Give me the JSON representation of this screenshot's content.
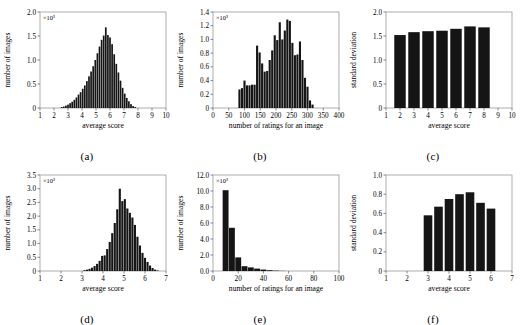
{
  "figure": {
    "panels": [
      {
        "id": "a",
        "caption": "(a)",
        "xlabel": "average score",
        "ylabel": "number of images",
        "exponent": "×10³",
        "xticks": [
          "1",
          "2",
          "3",
          "4",
          "5",
          "6",
          "7",
          "8",
          "9",
          "10"
        ],
        "yticks": [
          "0",
          "0.5",
          "1.0",
          "1.5",
          "2.0"
        ]
      },
      {
        "id": "b",
        "caption": "(b)",
        "xlabel": "number of ratings for an image",
        "ylabel": "number of images",
        "exponent": "×10³",
        "xticks": [
          "0",
          "50",
          "100",
          "150",
          "200",
          "250",
          "300",
          "350",
          "400"
        ],
        "yticks": [
          "0",
          "0.2",
          "0.4",
          "0.6",
          "0.8",
          "1.0",
          "1.2",
          "1.4"
        ]
      },
      {
        "id": "c",
        "caption": "(c)",
        "xlabel": "average score",
        "ylabel": "standard deviation",
        "exponent": "",
        "xticks": [
          "1",
          "2",
          "3",
          "4",
          "5",
          "6",
          "7",
          "8",
          "9",
          "10"
        ],
        "yticks": [
          "0",
          "0.5",
          "1.0",
          "1.5",
          "2.0"
        ]
      },
      {
        "id": "d",
        "caption": "(d)",
        "xlabel": "average score",
        "ylabel": "number of images",
        "exponent": "×10³",
        "xticks": [
          "1",
          "2",
          "3",
          "4",
          "5",
          "6",
          "7"
        ],
        "yticks": [
          "0",
          "0.5",
          "1.0",
          "1.5",
          "2.0",
          "2.5",
          "3.0",
          "3.5"
        ]
      },
      {
        "id": "e",
        "caption": "(e)",
        "xlabel": "number of ratings for an image",
        "ylabel": "number of images",
        "exponent": "×10³",
        "xticks": [
          "0",
          "20",
          "40",
          "60",
          "80",
          "100"
        ],
        "yticks": [
          "0.0",
          "2.0",
          "4.0",
          "6.0",
          "8.0",
          "10.0",
          "12.0"
        ]
      },
      {
        "id": "f",
        "caption": "(f)",
        "xlabel": "average score",
        "ylabel": "standard deviation",
        "exponent": "",
        "xticks": [
          "1",
          "2",
          "3",
          "4",
          "5",
          "6",
          "7"
        ],
        "yticks": [
          "0",
          "0.2",
          "0.4",
          "0.6",
          "0.8",
          "1.0"
        ]
      }
    ]
  },
  "chart_data": [
    {
      "type": "bar",
      "panel": "a",
      "title": "",
      "xlabel": "average score",
      "ylabel": "number of images",
      "y_exponent": 1000,
      "xlim": [
        1,
        10
      ],
      "ylim": [
        0,
        2.0
      ],
      "grid": false,
      "bin_width": 0.15,
      "x": [
        2.55,
        2.7,
        2.85,
        3.0,
        3.15,
        3.3,
        3.45,
        3.6,
        3.75,
        3.9,
        4.05,
        4.2,
        4.35,
        4.5,
        4.65,
        4.8,
        4.95,
        5.1,
        5.25,
        5.4,
        5.55,
        5.7,
        5.85,
        6.0,
        6.15,
        6.3,
        6.45,
        6.6,
        6.75,
        6.9,
        7.05,
        7.2,
        7.35,
        7.5,
        7.65,
        7.8
      ],
      "values": [
        0.02,
        0.03,
        0.05,
        0.07,
        0.1,
        0.13,
        0.17,
        0.22,
        0.28,
        0.33,
        0.4,
        0.47,
        0.56,
        0.66,
        0.76,
        0.87,
        1.0,
        1.14,
        1.28,
        1.42,
        1.51,
        1.68,
        1.52,
        1.47,
        1.33,
        1.12,
        0.92,
        0.74,
        0.57,
        0.42,
        0.3,
        0.21,
        0.14,
        0.08,
        0.04,
        0.02
      ]
    },
    {
      "type": "bar",
      "panel": "b",
      "title": "",
      "xlabel": "number of ratings for an image",
      "ylabel": "number of images",
      "y_exponent": 1000,
      "xlim": [
        0,
        400
      ],
      "ylim": [
        0,
        1.4
      ],
      "grid": false,
      "bin_width": 8,
      "x": [
        84,
        92,
        100,
        108,
        116,
        124,
        132,
        140,
        148,
        156,
        164,
        172,
        180,
        188,
        196,
        204,
        212,
        220,
        228,
        236,
        244,
        252,
        260,
        268,
        276,
        284,
        292,
        300,
        308,
        316
      ],
      "values": [
        0.27,
        0.29,
        0.4,
        0.33,
        0.33,
        0.34,
        0.34,
        0.91,
        0.81,
        0.65,
        0.53,
        0.54,
        0.7,
        0.84,
        1.06,
        0.99,
        1.25,
        1.0,
        1.13,
        1.29,
        1.27,
        0.95,
        0.77,
        0.78,
        0.97,
        0.7,
        0.44,
        0.31,
        0.11,
        0.05
      ]
    },
    {
      "type": "bar",
      "panel": "c",
      "title": "",
      "xlabel": "average score",
      "ylabel": "standard deviation",
      "y_exponent": 1,
      "xlim": [
        1,
        10
      ],
      "ylim": [
        0,
        2.0
      ],
      "grid": false,
      "categories": [
        "2",
        "3",
        "4",
        "5",
        "6",
        "7",
        "8"
      ],
      "bin_centers": [
        2.0,
        3.0,
        4.0,
        5.0,
        6.0,
        7.0,
        8.0
      ],
      "values": [
        1.52,
        1.58,
        1.6,
        1.61,
        1.65,
        1.7,
        1.68
      ]
    },
    {
      "type": "bar",
      "panel": "d",
      "title": "",
      "xlabel": "average score",
      "ylabel": "number of images",
      "y_exponent": 1000,
      "xlim": [
        1,
        7
      ],
      "ylim": [
        0,
        3.5
      ],
      "grid": false,
      "bin_width": 0.12,
      "x": [
        3.12,
        3.24,
        3.36,
        3.48,
        3.6,
        3.72,
        3.84,
        3.96,
        4.08,
        4.2,
        4.32,
        4.44,
        4.56,
        4.68,
        4.8,
        4.92,
        5.04,
        5.16,
        5.28,
        5.4,
        5.52,
        5.64,
        5.76,
        5.88,
        6.0,
        6.12,
        6.24,
        6.36,
        6.48,
        6.6
      ],
      "values": [
        0.03,
        0.05,
        0.08,
        0.12,
        0.18,
        0.26,
        0.37,
        0.55,
        0.57,
        0.8,
        1.06,
        1.38,
        1.75,
        2.25,
        3.0,
        2.55,
        2.62,
        2.28,
        2.12,
        1.95,
        1.68,
        1.25,
        0.93,
        0.66,
        0.48,
        0.33,
        0.2,
        0.11,
        0.05,
        0.02
      ]
    },
    {
      "type": "bar",
      "panel": "e",
      "title": "",
      "xlabel": "number of ratings for an image",
      "ylabel": "number of images",
      "y_exponent": 1000,
      "xlim": [
        0,
        100
      ],
      "ylim": [
        0,
        12.0
      ],
      "grid": false,
      "bin_width": 5,
      "x": [
        10,
        15,
        20,
        25,
        30,
        35,
        40,
        45,
        50,
        55
      ],
      "values": [
        10.1,
        5.4,
        1.7,
        0.6,
        0.45,
        0.3,
        0.18,
        0.1,
        0.05,
        0.02
      ]
    },
    {
      "type": "bar",
      "panel": "f",
      "title": "",
      "xlabel": "average score",
      "ylabel": "standard deviation",
      "y_exponent": 1,
      "xlim": [
        1,
        7
      ],
      "ylim": [
        0,
        1.0
      ],
      "grid": false,
      "categories": [
        "3",
        "3.5",
        "4",
        "4.5",
        "5",
        "5.5",
        "6"
      ],
      "bin_centers": [
        3.0,
        3.5,
        4.0,
        4.5,
        5.0,
        5.5,
        6.0
      ],
      "values": [
        0.58,
        0.67,
        0.75,
        0.8,
        0.82,
        0.71,
        0.65
      ]
    }
  ]
}
